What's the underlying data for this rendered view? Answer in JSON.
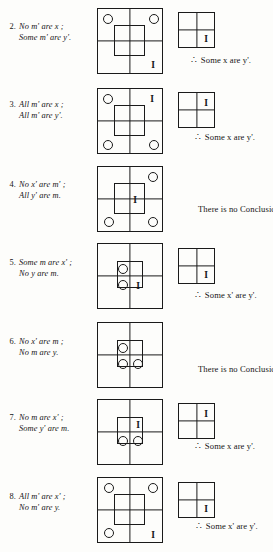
{
  "page": {
    "width": 273,
    "height": 552,
    "background": "#fdfdfb",
    "ink": "#1a1a1a",
    "marker_existence": "I",
    "therefore_symbol": "∴"
  },
  "rows": [
    {
      "number": "2.",
      "premise1": "No m' are x ;",
      "premise2": "Some m' are y'.",
      "big_diagram": {
        "markers": [
          {
            "type": "circle",
            "cx": 10,
            "cy": 10
          },
          {
            "type": "circle",
            "cx": 56,
            "cy": 10
          },
          {
            "type": "I",
            "cx": 55,
            "cy": 56
          }
        ],
        "inner": "normal"
      },
      "small_diagram": {
        "present": true,
        "markers": [
          {
            "type": "I",
            "cx": 27,
            "cy": 26
          }
        ]
      },
      "conclusion": "Some x  are y'.",
      "has_therefore": true
    },
    {
      "number": "3.",
      "premise1": "All m' are x ;",
      "premise2": "All m' are y'.",
      "big_diagram": {
        "markers": [
          {
            "type": "circle",
            "cx": 10,
            "cy": 10
          },
          {
            "type": "I",
            "cx": 54,
            "cy": 10
          },
          {
            "type": "circle",
            "cx": 10,
            "cy": 56
          },
          {
            "type": "circle",
            "cx": 56,
            "cy": 56
          }
        ],
        "inner": "normal"
      },
      "small_diagram": {
        "present": true,
        "markers": [
          {
            "type": "I",
            "cx": 27,
            "cy": 10
          }
        ]
      },
      "conclusion": "Some x are y'.",
      "has_therefore": true
    },
    {
      "number": "4.",
      "premise1": "No x' are m' ;",
      "premise2": "All y' are m.",
      "big_diagram": {
        "markers": [
          {
            "type": "circle",
            "cx": 55,
            "cy": 10
          },
          {
            "type": "I",
            "cx": 37,
            "cy": 33
          },
          {
            "type": "circle",
            "cx": 11,
            "cy": 55
          },
          {
            "type": "circle",
            "cx": 55,
            "cy": 55
          }
        ],
        "inner": "normal"
      },
      "small_diagram": {
        "present": false,
        "markers": []
      },
      "conclusion": "There is no Conclusion",
      "has_therefore": false
    },
    {
      "number": "5.",
      "premise1": "Some m are x' ;",
      "premise2": "No y are m.",
      "big_diagram": {
        "markers": [
          {
            "type": "circle",
            "cx": 25,
            "cy": 25
          },
          {
            "type": "circle",
            "cx": 25,
            "cy": 41
          },
          {
            "type": "I",
            "cx": 40,
            "cy": 42
          }
        ],
        "inner": "small"
      },
      "small_diagram": {
        "present": true,
        "markers": [
          {
            "type": "I",
            "cx": 27,
            "cy": 26
          }
        ]
      },
      "conclusion": "Some x' are y'.",
      "has_therefore": true
    },
    {
      "number": "6.",
      "premise1": "No x' are m ;",
      "premise2": "No m are y.",
      "big_diagram": {
        "markers": [
          {
            "type": "circle",
            "cx": 25,
            "cy": 25
          },
          {
            "type": "circle",
            "cx": 25,
            "cy": 41
          },
          {
            "type": "circle",
            "cx": 40,
            "cy": 41
          }
        ],
        "inner": "small"
      },
      "small_diagram": {
        "present": false,
        "markers": []
      },
      "conclusion": "There is no Conclusion.",
      "has_therefore": false
    },
    {
      "number": "7.",
      "premise1": "No m are x' ;",
      "premise2": "Some y' are m.",
      "big_diagram": {
        "markers": [
          {
            "type": "I",
            "cx": 40,
            "cy": 25
          },
          {
            "type": "circle",
            "cx": 25,
            "cy": 41
          },
          {
            "type": "circle",
            "cx": 40,
            "cy": 41
          }
        ],
        "inner": "small"
      },
      "small_diagram": {
        "present": true,
        "markers": [
          {
            "type": "I",
            "cx": 27,
            "cy": 10
          }
        ]
      },
      "conclusion": "Some x are y'.",
      "has_therefore": true
    },
    {
      "number": "8.",
      "premise1": "All m' are x' ;",
      "premise2": "No m' are y.",
      "big_diagram": {
        "markers": [
          {
            "type": "circle",
            "cx": 11,
            "cy": 10
          },
          {
            "type": "circle",
            "cx": 55,
            "cy": 10
          },
          {
            "type": "circle",
            "cx": 11,
            "cy": 55
          },
          {
            "type": "I",
            "cx": 55,
            "cy": 57
          }
        ],
        "inner": "normal"
      },
      "small_diagram": {
        "present": true,
        "markers": [
          {
            "type": "I",
            "cx": 27,
            "cy": 26
          }
        ]
      },
      "conclusion": "Some x' are y'.",
      "has_therefore": true
    }
  ],
  "layout": {
    "row_tops": [
      8,
      88,
      166,
      243,
      322,
      399,
      477
    ],
    "premise_tops": [
      22,
      100,
      180,
      258,
      337,
      413,
      492
    ],
    "big_left": 97,
    "small_left": 178,
    "small_tops": [
      12,
      92,
      0,
      248,
      0,
      403,
      482
    ],
    "conclusion_tops": [
      55,
      132,
      204,
      290,
      364,
      441,
      521
    ],
    "conclusion_lefts": [
      191,
      195,
      198,
      195,
      198,
      195,
      196
    ]
  }
}
